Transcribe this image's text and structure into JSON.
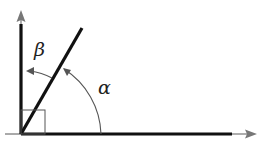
{
  "diagram": {
    "type": "angle-diagram",
    "labels": {
      "beta": "β",
      "alpha": "α"
    },
    "elements": {
      "vertical_axis": "vertical ray with arrowhead pointing up",
      "horizontal_axis": "horizontal ray with arrowhead pointing right",
      "diagonal_ray": "ray from origin between the two axes",
      "right_angle_marker": "square at origin",
      "alpha_arc": "arc from horizontal axis to diagonal ray with arrowhead",
      "beta_arc": "arc from diagonal ray to vertical axis with arrowhead"
    },
    "colors": {
      "line": "#111111",
      "arc": "#555555",
      "axis_tip": "#777777"
    }
  }
}
